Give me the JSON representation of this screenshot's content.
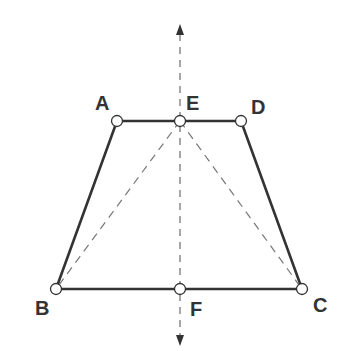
{
  "diagram": {
    "type": "isosceles-trapezoid-with-symmetry-axis",
    "colors": {
      "solid": "#333333",
      "dashed": "#777777",
      "point_fill": "#ffffff",
      "label": "#333333"
    },
    "points": [
      {
        "id": "A",
        "label": "A",
        "x": 117,
        "y": 121,
        "lx": 95,
        "ly": 110
      },
      {
        "id": "E",
        "label": "E",
        "x": 180,
        "y": 121,
        "lx": 186,
        "ly": 110
      },
      {
        "id": "D",
        "label": "D",
        "x": 241,
        "y": 121,
        "lx": 251,
        "ly": 114
      },
      {
        "id": "B",
        "label": "B",
        "x": 56,
        "y": 289,
        "lx": 35,
        "ly": 315
      },
      {
        "id": "F",
        "label": "F",
        "x": 180,
        "y": 289,
        "lx": 190,
        "ly": 316
      },
      {
        "id": "C",
        "label": "C",
        "x": 302,
        "y": 289,
        "lx": 313,
        "ly": 312
      }
    ],
    "solid_segments": [
      [
        "A",
        "D"
      ],
      [
        "A",
        "B"
      ],
      [
        "D",
        "C"
      ],
      [
        "B",
        "C"
      ]
    ],
    "dashed_segments": [
      [
        "E",
        "B"
      ],
      [
        "E",
        "C"
      ]
    ],
    "axis": {
      "x": 180,
      "y_top": 24,
      "y_bottom": 346,
      "arrows": "both"
    }
  }
}
